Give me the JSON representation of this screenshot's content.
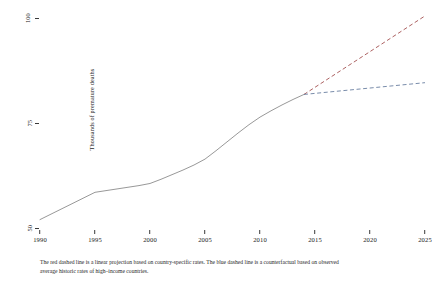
{
  "chart_data": {
    "type": "line",
    "title": "",
    "xlabel": "",
    "ylabel": "Thousands of premature deaths",
    "xlim": [
      1990,
      2025
    ],
    "ylim": [
      50,
      100
    ],
    "grid": false,
    "legend": "none",
    "x_ticks": [
      "1990",
      "1995",
      "2000",
      "2005",
      "2010",
      "2015",
      "2020",
      "2025"
    ],
    "x_tick_values": [
      1990,
      1995,
      2000,
      2005,
      2010,
      2015,
      2020,
      2025
    ],
    "y_ticks": [
      "50",
      "75",
      "100"
    ],
    "y_tick_values": [
      50,
      75,
      100
    ],
    "series": [
      {
        "name": "Observed premature deaths",
        "style": "solid",
        "color": "#8c8c8c",
        "x": [
          1990,
          1991,
          1992,
          1993,
          1994,
          1995,
          1996,
          1997,
          1998,
          1999,
          2000,
          2001,
          2002,
          2003,
          2004,
          2005,
          2006,
          2007,
          2008,
          2009,
          2010,
          2011,
          2012,
          2013,
          2014
        ],
        "values": [
          52.0,
          53.3,
          54.6,
          55.9,
          57.2,
          58.5,
          58.9,
          59.3,
          59.7,
          60.1,
          60.6,
          61.6,
          62.7,
          63.8,
          65.0,
          66.4,
          68.4,
          70.5,
          72.6,
          74.6,
          76.4,
          77.9,
          79.3,
          80.6,
          81.8
        ]
      },
      {
        "name": "Linear projection based on country-specific rates",
        "style": "dashed",
        "color": "#a35050",
        "x": [
          2014,
          2025
        ],
        "values": [
          81.8,
          100.5
        ]
      },
      {
        "name": "Counterfactual based on observed average historic rates of high-income countries",
        "style": "dashed",
        "color": "#6a7fa0",
        "x": [
          2014,
          2025
        ],
        "values": [
          81.8,
          84.6
        ]
      }
    ],
    "annotations": {
      "caption_line_1": "The red dashed line is a linear projection based on country-specific rates. The blue dashed line is a counterfactual based on observed",
      "caption_line_2": "average historic rates of high–income countries."
    }
  }
}
